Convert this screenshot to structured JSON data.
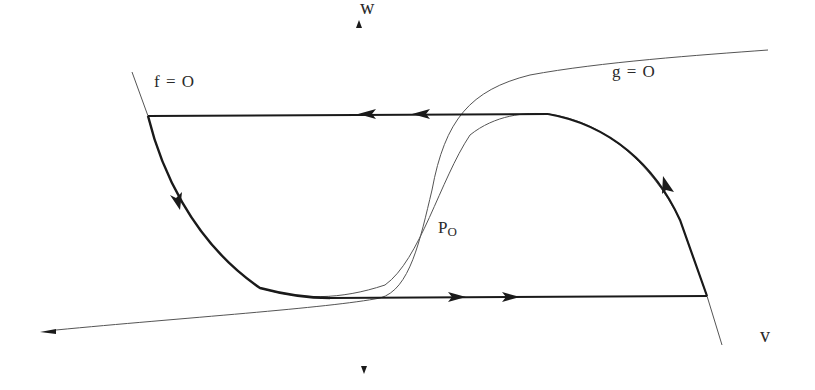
{
  "diagram": {
    "type": "phase-plane",
    "axes": {
      "vertical_label": "w",
      "horizontal_label": "v"
    },
    "nullclines": {
      "f": {
        "label": "f  = O"
      },
      "g": {
        "label": "g  =  O"
      }
    },
    "fixed_point": {
      "label": "P",
      "subscript": "O"
    },
    "limit_cycle": {
      "description": "relaxation oscillation trajectory",
      "arrows": [
        "left along top branch (2 arrows)",
        "down along left branch",
        "right along bottom branch (2 arrows)",
        "up along right branch"
      ]
    },
    "colors": {
      "stroke": "#1a1a1a",
      "thin_stroke": "#555555",
      "background": "#ffffff"
    }
  }
}
